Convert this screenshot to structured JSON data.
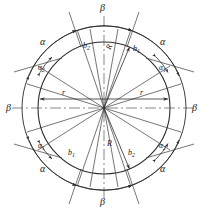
{
  "figure": {
    "geometry": {
      "center_x": 104,
      "center_y": 108,
      "outer_radius": 82,
      "inner_radius": 66,
      "stroke_color": "#2b2b2b",
      "centerline_color": "#555555",
      "background": "#ffffff"
    },
    "labels": {
      "beta_top": "β",
      "beta_bottom": "β",
      "beta_left": "β",
      "beta_right": "β",
      "alpha_top_left": "α",
      "alpha_top_right": "α",
      "alpha_bottom_left": "α",
      "alpha_bottom_right": "α",
      "alpha2_top_left_base": "α",
      "alpha2_top_left_sub": "2",
      "alpha1_top_right_base": "α",
      "alpha1_top_right_sub": "1",
      "alpha1_bottom_left_base": "α",
      "alpha1_bottom_left_sub": "1",
      "alpha2_bottom_right_base": "α",
      "alpha2_bottom_right_sub": "2",
      "b2_top_left_base": "b",
      "b2_top_left_sub": "2",
      "b1_top_right_base": "b",
      "b1_top_right_sub": "1",
      "b1_bottom_left_base": "b",
      "b1_bottom_left_sub": "1",
      "b2_bottom_right_base": "b",
      "b2_bottom_right_sub": "2",
      "r_left": "r",
      "r_right": "r",
      "R_top": "R",
      "R_bottom": "R"
    }
  }
}
